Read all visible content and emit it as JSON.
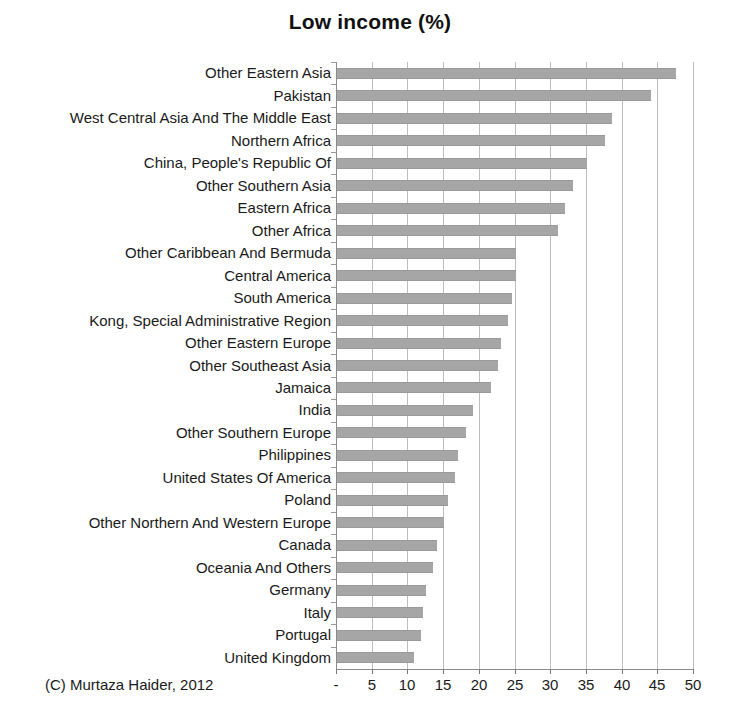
{
  "chart_data": {
    "type": "bar",
    "orientation": "horizontal",
    "title": "Low income (%)",
    "xlabel": "",
    "ylabel": "",
    "xlim": [
      0,
      50
    ],
    "xticks": [
      "-",
      "5",
      "10",
      "15",
      "20",
      "25",
      "30",
      "35",
      "40",
      "45",
      "50"
    ],
    "xtick_values": [
      0,
      5,
      10,
      15,
      20,
      25,
      30,
      35,
      40,
      45,
      50
    ],
    "grid": true,
    "legend": false,
    "bar_color": "#a6a6a6",
    "categories": [
      "Other Eastern Asia",
      "Pakistan",
      "West Central Asia And The Middle East",
      "Northern Africa",
      "China, People's Republic Of",
      "Other Southern Asia",
      "Eastern Africa",
      "Other Africa",
      "Other Caribbean And Bermuda",
      "Central America",
      "South America",
      "Kong, Special Administrative Region",
      "Other Eastern Europe",
      "Other Southeast Asia",
      "Jamaica",
      "India",
      "Other Southern Europe",
      "Philippines",
      "United States Of America",
      "Poland",
      "Other Northern And Western Europe",
      "Canada",
      "Oceania And Others",
      "Germany",
      "Italy",
      "Portugal",
      "United Kingdom"
    ],
    "values": [
      47.5,
      44.0,
      38.5,
      37.5,
      35.0,
      33.0,
      32.0,
      31.0,
      25.0,
      25.0,
      24.5,
      24.0,
      23.0,
      22.5,
      21.5,
      19.0,
      18.0,
      17.0,
      16.5,
      15.5,
      15.0,
      14.0,
      13.5,
      12.5,
      12.0,
      11.8,
      10.8
    ],
    "annotations": {
      "credit": "(C) Murtaza Haider, 2012"
    }
  }
}
